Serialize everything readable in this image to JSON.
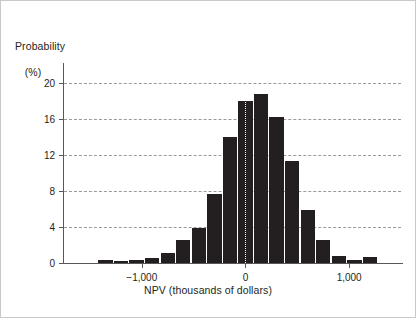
{
  "chart_data": {
    "type": "bar",
    "title": "",
    "subtitle": "",
    "ylabel_line1": "Probability",
    "ylabel_line2": "(%)",
    "xlabel": "NPV (thousands of dollars)",
    "ylim": [
      0,
      21.5
    ],
    "xlim": [
      -1750,
      1500
    ],
    "yticks": [
      0,
      4,
      8,
      12,
      16,
      20
    ],
    "ytick_labels": [
      "0",
      "4",
      "8",
      "12",
      "16",
      "20"
    ],
    "xticks": [
      -1000,
      0,
      1000
    ],
    "xtick_labels": [
      "−1,000",
      "0",
      "1,000"
    ],
    "grid": "horizontal-dashed",
    "legend": "none",
    "bar_color": "#231f20",
    "grid_color": "#9a9a9a",
    "axis_color": "#58585a",
    "center_reference_x": 0,
    "bin_width": 150,
    "categories": [
      -1350,
      -1200,
      -1050,
      -900,
      -750,
      -600,
      -450,
      -300,
      -150,
      0,
      150,
      300,
      450,
      600,
      750,
      900,
      1050,
      1200
    ],
    "values": [
      0.35,
      0.25,
      0.3,
      0.55,
      1.1,
      2.5,
      3.9,
      7.7,
      14.0,
      18.0,
      18.7,
      16.2,
      11.3,
      5.9,
      2.6,
      0.8,
      0.3,
      0.7
    ],
    "annotations": []
  },
  "figure": {
    "border_color": "#c9c9c9",
    "background": "#ffffff"
  }
}
